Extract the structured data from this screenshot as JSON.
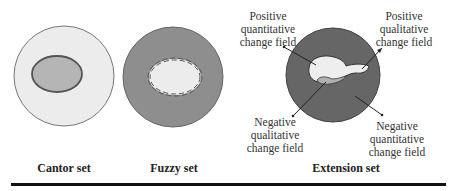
{
  "diagram": {
    "panels": [
      {
        "title": "Cantor set"
      },
      {
        "title": "Fuzzy set"
      },
      {
        "title": "Extension set"
      }
    ],
    "labels": {
      "pos_quant": [
        "Positive",
        "quantitative",
        "change field"
      ],
      "pos_qual": [
        "Positive",
        "qualitative",
        "change field"
      ],
      "neg_qual": [
        "Negative",
        "qualitative",
        "change field"
      ],
      "neg_quant": [
        "Negative",
        "quantitative",
        "change field"
      ]
    },
    "colors": {
      "light_fill": "#ececec",
      "mid_fill": "#b9b9b9",
      "dark_fill": "#8e8e8e",
      "extension_dark": "#666666",
      "outline": "#555555"
    }
  }
}
